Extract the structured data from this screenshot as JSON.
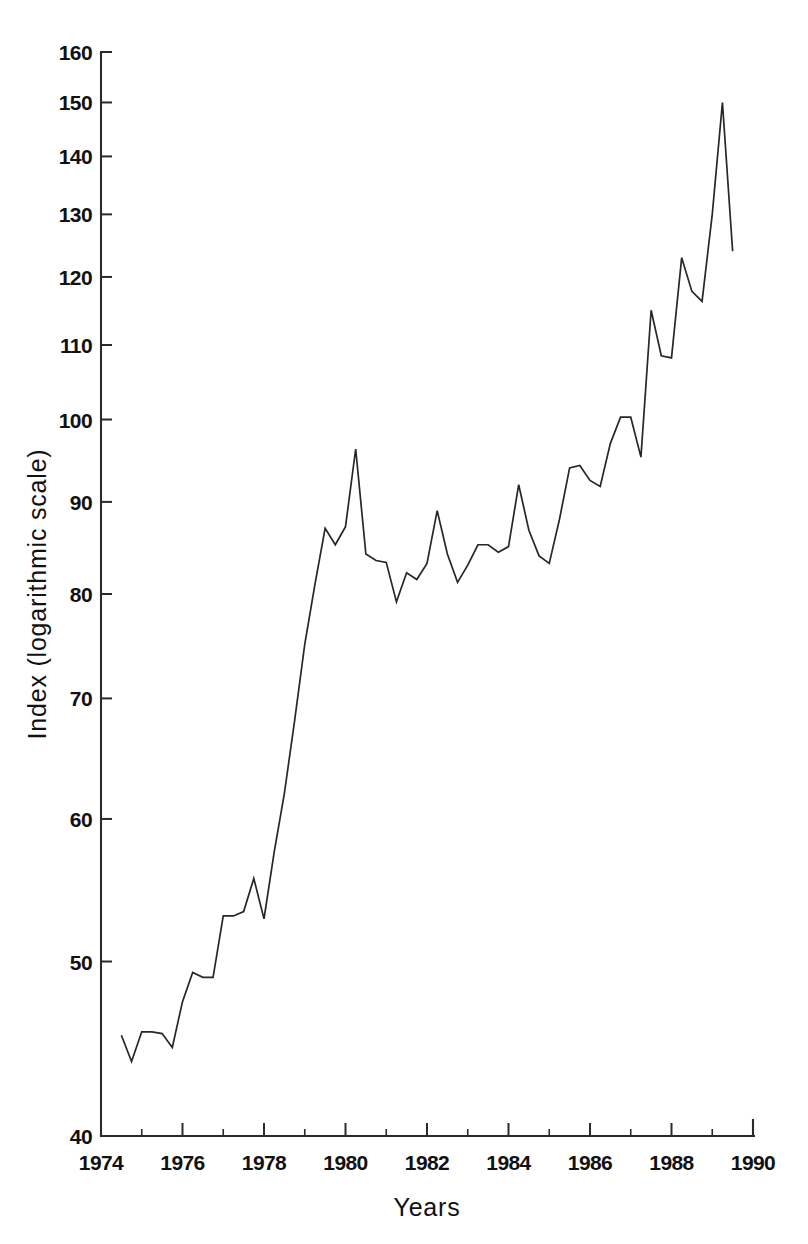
{
  "chart_data": {
    "type": "line",
    "title": "",
    "xlabel": "Years",
    "ylabel": "Index (logarithmic scale)",
    "yscale": "log",
    "xlim": [
      1974,
      1990
    ],
    "ylim": [
      40,
      160
    ],
    "grid": false,
    "legend": "none",
    "y_ticks": [
      40,
      50,
      60,
      70,
      80,
      90,
      100,
      110,
      120,
      130,
      140,
      150,
      160
    ],
    "y_tick_labels": [
      "40",
      "50",
      "60",
      "70",
      "80",
      "90",
      "100",
      "110",
      "120",
      "130",
      "140",
      "150",
      "160"
    ],
    "x_ticks": [
      1974,
      1976,
      1978,
      1980,
      1982,
      1984,
      1986,
      1988,
      1990
    ],
    "x_tick_labels": [
      "1974",
      "1976",
      "1978",
      "1980",
      "1982",
      "1984",
      "1986",
      "1988",
      "1990"
    ],
    "x_minor_ticks": [
      1975,
      1977,
      1979,
      1981,
      1983,
      1985,
      1987,
      1989
    ],
    "line_color": "#26262b",
    "series": [
      {
        "name": "Index",
        "x": [
          1974.5,
          1974.75,
          1975.0,
          1975.25,
          1975.5,
          1975.75,
          1976.0,
          1976.25,
          1976.5,
          1976.75,
          1977.0,
          1977.25,
          1977.5,
          1977.75,
          1978.0,
          1978.25,
          1978.5,
          1978.75,
          1979.0,
          1979.25,
          1979.5,
          1979.75,
          1980.0,
          1980.25,
          1980.5,
          1980.75,
          1981.0,
          1981.25,
          1981.5,
          1981.75,
          1982.0,
          1982.25,
          1982.5,
          1982.75,
          1983.0,
          1983.25,
          1983.5,
          1983.75,
          1984.0,
          1984.25,
          1984.5,
          1984.75,
          1985.0,
          1985.25,
          1985.5,
          1985.75,
          1986.0,
          1986.25,
          1986.5,
          1986.75,
          1987.0,
          1987.25,
          1987.5,
          1987.75,
          1988.0,
          1988.25,
          1988.5,
          1988.75,
          1989.0,
          1989.25,
          1989.5
        ],
        "y": [
          45.5,
          44.0,
          45.7,
          45.7,
          45.6,
          44.8,
          47.5,
          49.3,
          49.0,
          49.0,
          53.0,
          53.0,
          53.3,
          55.6,
          52.8,
          57.5,
          62.0,
          68.0,
          75.0,
          81.0,
          87.0,
          85.2,
          87.2,
          96.3,
          84.2,
          83.5,
          83.3,
          79.2,
          82.2,
          81.5,
          83.2,
          89.0,
          84.2,
          81.2,
          83.0,
          85.2,
          85.2,
          84.4,
          85.0,
          92.0,
          86.8,
          84.0,
          83.2,
          88.0,
          94.0,
          94.3,
          92.5,
          91.8,
          97.0,
          100.3,
          100.3,
          95.3,
          115.0,
          108.5,
          108.2,
          123.0,
          117.8,
          116.3,
          130.0,
          150.0,
          124.0
        ]
      }
    ]
  },
  "axes": {
    "ylabel": "Index (logarithmic scale)",
    "xlabel": "Years"
  }
}
